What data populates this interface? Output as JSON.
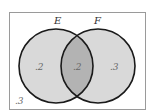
{
  "diagram": {
    "type": "venn",
    "sets": [
      {
        "label": "E",
        "only_value": ".2"
      },
      {
        "label": "F",
        "only_value": ".3"
      }
    ],
    "intersection_value": ".2",
    "outside_value": ".3",
    "colors": {
      "set_fill": "#d9d9d9",
      "intersection_fill": "#b3b3b3",
      "stroke": "#1a1a1a",
      "border": "#9a9a9a"
    }
  }
}
